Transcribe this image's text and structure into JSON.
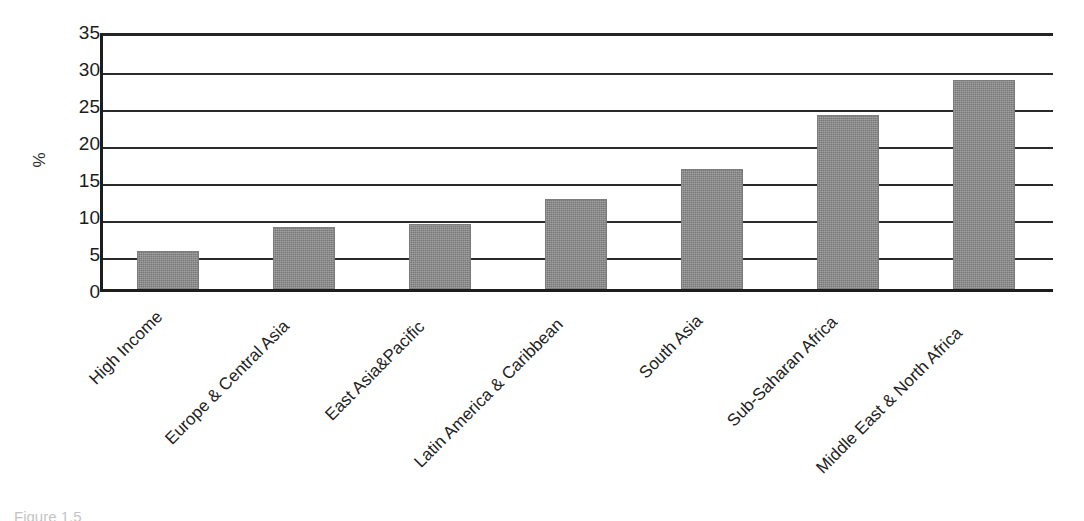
{
  "chart_data": {
    "type": "bar",
    "title": "",
    "subtitle": "",
    "xlabel": "",
    "ylabel": "%",
    "ylim": [
      0,
      35
    ],
    "ytick_interval": 5,
    "yticks": [
      "35",
      "30",
      "25",
      "20",
      "15",
      "10",
      "5",
      "0"
    ],
    "grid": "horizontal",
    "legend": "none",
    "bar_color": "#8a8a8a",
    "axis_color": "#1d1d1d",
    "categories": [
      "High Income",
      "Europe & Central Asia",
      "East Asia&Pacific",
      "Latin America & Caribbean",
      "South Asia",
      "Sub-Saharan Africa",
      "Middle East & North Africa"
    ],
    "values": [
      5.2,
      8.4,
      8.8,
      12.2,
      16.2,
      23.5,
      28.2
    ],
    "annotations": []
  },
  "figure": {
    "caption": "Figure 1.5"
  },
  "axis": {
    "y_title": "%"
  }
}
